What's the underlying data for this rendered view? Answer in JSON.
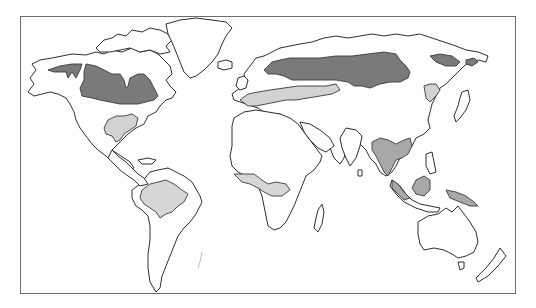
{
  "map": {
    "type": "world-outline",
    "projection": "equirectangular",
    "background": "#ffffff",
    "frame_color": "#6e6e6e",
    "outline_color": "#2e2e2e",
    "legend_visible": false,
    "shading": {
      "dark": {
        "color": "#7a7a7a",
        "regions": [
          "northern-canada-alaska",
          "scandinavia-russia-siberia",
          "kamchatka-okhotsk"
        ]
      },
      "medium": {
        "color": "#a8a8a8",
        "regions": [
          "southeast-asia",
          "borneo",
          "new-guinea"
        ]
      },
      "light": {
        "color": "#d2d2d2",
        "regions": [
          "eastern-united-states",
          "europe-western-russia",
          "manchuria",
          "amazon-basin",
          "central-africa",
          "indochina"
        ]
      }
    }
  }
}
